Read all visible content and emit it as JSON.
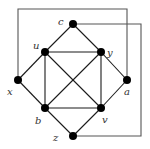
{
  "diagram": {
    "type": "graph",
    "nodes": [
      {
        "id": "c",
        "label": "c",
        "x": 73,
        "y": 24,
        "lx": 58,
        "ly": 25
      },
      {
        "id": "u",
        "label": "u",
        "x": 45,
        "y": 52,
        "lx": 33,
        "ly": 49
      },
      {
        "id": "y",
        "label": "y",
        "x": 101,
        "y": 52,
        "lx": 107,
        "ly": 56
      },
      {
        "id": "x",
        "label": "x",
        "x": 18,
        "y": 80,
        "lx": 7,
        "ly": 95
      },
      {
        "id": "a",
        "label": "a",
        "x": 127,
        "y": 80,
        "lx": 124,
        "ly": 95
      },
      {
        "id": "b",
        "label": "b",
        "x": 45,
        "y": 108,
        "lx": 35,
        "ly": 124
      },
      {
        "id": "v",
        "label": "v",
        "x": 101,
        "y": 108,
        "lx": 102,
        "ly": 123
      },
      {
        "id": "z",
        "label": "z",
        "x": 73,
        "y": 136,
        "lx": 53,
        "ly": 141
      }
    ],
    "edges": [
      [
        "c",
        "u"
      ],
      [
        "c",
        "y"
      ],
      [
        "u",
        "y"
      ],
      [
        "u",
        "x"
      ],
      [
        "u",
        "b"
      ],
      [
        "u",
        "v"
      ],
      [
        "y",
        "a"
      ],
      [
        "y",
        "v"
      ],
      [
        "y",
        "b"
      ],
      [
        "x",
        "b"
      ],
      [
        "a",
        "v"
      ],
      [
        "b",
        "v"
      ],
      [
        "b",
        "z"
      ],
      [
        "v",
        "z"
      ]
    ],
    "routed_edges": [
      {
        "from": "x",
        "to": "a",
        "path": [
          [
            18,
            80
          ],
          [
            18,
            9
          ],
          [
            127,
            9
          ],
          [
            127,
            80
          ]
        ]
      },
      {
        "from": "c",
        "to": "z",
        "path": [
          [
            73,
            24
          ],
          [
            141,
            24
          ],
          [
            141,
            136
          ],
          [
            73,
            136
          ]
        ]
      }
    ],
    "colors": {
      "node": "#000000",
      "edge": "#1a1a1a",
      "frame": "#555555",
      "label": "#333333"
    }
  }
}
